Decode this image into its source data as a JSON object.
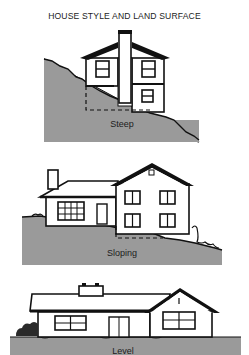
{
  "title": "HOUSE STYLE AND LAND SURFACE",
  "panels": [
    {
      "label": "Steep",
      "ground_color": "#9a9a9a"
    },
    {
      "label": "Sloping",
      "ground_color": "#9a9a9a"
    },
    {
      "label": "Level",
      "ground_color": "#9a9a9a"
    }
  ]
}
